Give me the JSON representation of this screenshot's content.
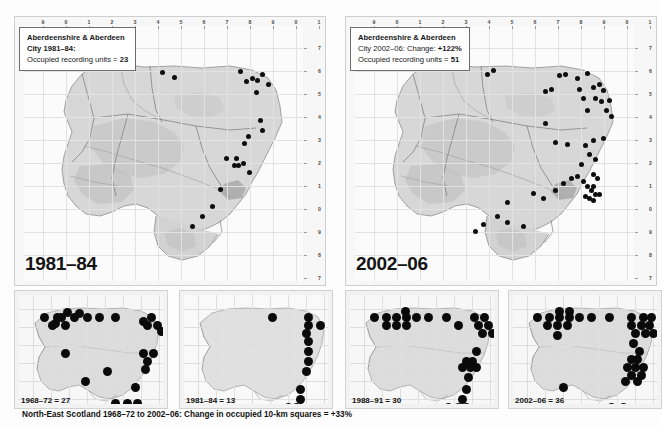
{
  "figure": {
    "caption": "North-East Scotland 1968–72 to 2002–06: Change in occupied 10-km squares = +33%",
    "caption_value": "+33%",
    "background": "#fdfdfd",
    "dot_color": "#0d0d0d"
  },
  "main_maps": [
    {
      "id": "map-left",
      "info_line1": "Aberdeenshire & Aberdeen",
      "info_line2": "City 1981–84:",
      "info_line3_prefix": "Occupied recording units = ",
      "info_line3_value": "23",
      "big_year": "1981–84",
      "occupied_units": 23,
      "top_ticks": [
        "9",
        "0",
        "1",
        "2",
        "3",
        "4",
        "5",
        "6",
        "7",
        "8",
        "9",
        "0",
        "1"
      ],
      "right_ticks": [
        "7",
        "6",
        "5",
        "4",
        "3",
        "2",
        "1",
        "0",
        "9",
        "8",
        "7"
      ],
      "dots": [
        [
          138,
          46
        ],
        [
          150,
          51
        ],
        [
          216,
          45
        ],
        [
          222,
          55
        ],
        [
          228,
          52
        ],
        [
          233,
          54
        ],
        [
          238,
          48
        ],
        [
          244,
          58
        ],
        [
          232,
          66
        ],
        [
          236,
          94
        ],
        [
          238,
          104
        ],
        [
          224,
          110
        ],
        [
          220,
          117
        ],
        [
          202,
          132
        ],
        [
          212,
          132
        ],
        [
          210,
          139
        ],
        [
          214,
          139
        ],
        [
          219,
          137
        ],
        [
          225,
          146
        ],
        [
          196,
          163
        ],
        [
          188,
          180
        ],
        [
          178,
          190
        ],
        [
          168,
          200
        ]
      ]
    },
    {
      "id": "map-right",
      "info_line1": "Aberdeenshire & Aberdeen",
      "info_line2_prefix": "City 2002–06: Change: ",
      "info_line2_value": "+122%",
      "info_line3_prefix": "Occupied recording units = ",
      "info_line3_value": "51",
      "big_year": "2002–06",
      "occupied_units": 51,
      "change_percent": "+122%",
      "top_ticks": [
        "9",
        "0",
        "1",
        "2",
        "3",
        "4",
        "5",
        "6",
        "7",
        "8",
        "9",
        "0",
        "1"
      ],
      "right_ticks": [
        "7",
        "6",
        "5",
        "4",
        "3",
        "2",
        "1",
        "0",
        "9",
        "8",
        "7"
      ],
      "dots": [
        [
          132,
          48
        ],
        [
          138,
          44
        ],
        [
          190,
          65
        ],
        [
          196,
          63
        ],
        [
          204,
          49
        ],
        [
          210,
          48
        ],
        [
          222,
          52
        ],
        [
          232,
          47
        ],
        [
          224,
          63
        ],
        [
          228,
          72
        ],
        [
          238,
          61
        ],
        [
          244,
          58
        ],
        [
          248,
          64
        ],
        [
          240,
          72
        ],
        [
          246,
          75
        ],
        [
          232,
          84
        ],
        [
          251,
          84
        ],
        [
          254,
          74
        ],
        [
          256,
          90
        ],
        [
          190,
          97
        ],
        [
          200,
          116
        ],
        [
          212,
          118
        ],
        [
          230,
          119
        ],
        [
          238,
          114
        ],
        [
          248,
          112
        ],
        [
          234,
          128
        ],
        [
          240,
          133
        ],
        [
          226,
          138
        ],
        [
          216,
          152
        ],
        [
          222,
          150
        ],
        [
          228,
          155
        ],
        [
          238,
          148
        ],
        [
          242,
          152
        ],
        [
          232,
          160
        ],
        [
          236,
          164
        ],
        [
          238,
          160
        ],
        [
          240,
          168
        ],
        [
          230,
          170
        ],
        [
          234,
          172
        ],
        [
          238,
          174
        ],
        [
          244,
          168
        ],
        [
          208,
          157
        ],
        [
          200,
          164
        ],
        [
          188,
          172
        ],
        [
          178,
          167
        ],
        [
          152,
          176
        ],
        [
          142,
          190
        ],
        [
          152,
          196
        ],
        [
          168,
          200
        ],
        [
          120,
          205
        ],
        [
          128,
          198
        ]
      ]
    }
  ],
  "small_panels": [
    {
      "id": "sp0",
      "label_prefix": "1968–72 = ",
      "label_value": "27",
      "label": "1968–72 = 27",
      "count": 27,
      "dots": [
        [
          25,
          22
        ],
        [
          38,
          22
        ],
        [
          48,
          17
        ],
        [
          60,
          18
        ],
        [
          36,
          28
        ],
        [
          42,
          22
        ],
        [
          55,
          22
        ],
        [
          68,
          22
        ],
        [
          80,
          22
        ],
        [
          96,
          22
        ],
        [
          46,
          30
        ],
        [
          33,
          30
        ],
        [
          124,
          26
        ],
        [
          132,
          22
        ],
        [
          128,
          30
        ],
        [
          138,
          30
        ],
        [
          142,
          36
        ],
        [
          46,
          58
        ],
        [
          88,
          76
        ],
        [
          66,
          86
        ],
        [
          124,
          58
        ],
        [
          134,
          58
        ],
        [
          128,
          66
        ],
        [
          126,
          74
        ],
        [
          116,
          92
        ],
        [
          96,
          108
        ],
        [
          108,
          108
        ],
        [
          118,
          108
        ]
      ]
    },
    {
      "id": "sp1",
      "label_prefix": "1981–84 = ",
      "label_value": "13",
      "label": "1981–84 = 13",
      "count": 13,
      "dots": [
        [
          88,
          22
        ],
        [
          124,
          22
        ],
        [
          124,
          30
        ],
        [
          136,
          30
        ],
        [
          122,
          38
        ],
        [
          124,
          46
        ],
        [
          124,
          56
        ],
        [
          124,
          66
        ],
        [
          122,
          76
        ],
        [
          116,
          94
        ],
        [
          116,
          104
        ],
        [
          112,
          112
        ],
        [
          104,
          112
        ]
      ]
    },
    {
      "id": "sp2",
      "label_prefix": "1988–91 = ",
      "label_value": "30",
      "label": "1988–91 = 30",
      "count": 30,
      "dots": [
        [
          24,
          22
        ],
        [
          36,
          22
        ],
        [
          46,
          22
        ],
        [
          55,
          16
        ],
        [
          56,
          22
        ],
        [
          66,
          22
        ],
        [
          78,
          22
        ],
        [
          96,
          22
        ],
        [
          36,
          30
        ],
        [
          46,
          30
        ],
        [
          56,
          30
        ],
        [
          108,
          30
        ],
        [
          124,
          22
        ],
        [
          134,
          22
        ],
        [
          128,
          30
        ],
        [
          138,
          30
        ],
        [
          132,
          38
        ],
        [
          142,
          38
        ],
        [
          126,
          56
        ],
        [
          116,
          66
        ],
        [
          122,
          66
        ],
        [
          112,
          72
        ],
        [
          120,
          72
        ],
        [
          126,
          72
        ],
        [
          118,
          82
        ],
        [
          116,
          94
        ],
        [
          112,
          104
        ],
        [
          98,
          112
        ],
        [
          108,
          112
        ],
        [
          116,
          112
        ]
      ]
    },
    {
      "id": "sp3",
      "label_prefix": "2002–06 = ",
      "label_value": "36",
      "label": "2002–06 = 36",
      "count": 36,
      "dots": [
        [
          24,
          22
        ],
        [
          36,
          22
        ],
        [
          46,
          16
        ],
        [
          56,
          16
        ],
        [
          46,
          22
        ],
        [
          56,
          22
        ],
        [
          66,
          22
        ],
        [
          78,
          22
        ],
        [
          96,
          22
        ],
        [
          34,
          30
        ],
        [
          44,
          30
        ],
        [
          54,
          30
        ],
        [
          118,
          22
        ],
        [
          130,
          22
        ],
        [
          138,
          22
        ],
        [
          118,
          30
        ],
        [
          128,
          30
        ],
        [
          136,
          30
        ],
        [
          122,
          38
        ],
        [
          132,
          38
        ],
        [
          140,
          38
        ],
        [
          44,
          40
        ],
        [
          120,
          48
        ],
        [
          126,
          56
        ],
        [
          118,
          64
        ],
        [
          124,
          64
        ],
        [
          114,
          72
        ],
        [
          122,
          72
        ],
        [
          130,
          72
        ],
        [
          118,
          80
        ],
        [
          112,
          86
        ],
        [
          124,
          86
        ],
        [
          50,
          92
        ],
        [
          98,
          112
        ],
        [
          110,
          112
        ],
        [
          128,
          80
        ]
      ]
    }
  ]
}
